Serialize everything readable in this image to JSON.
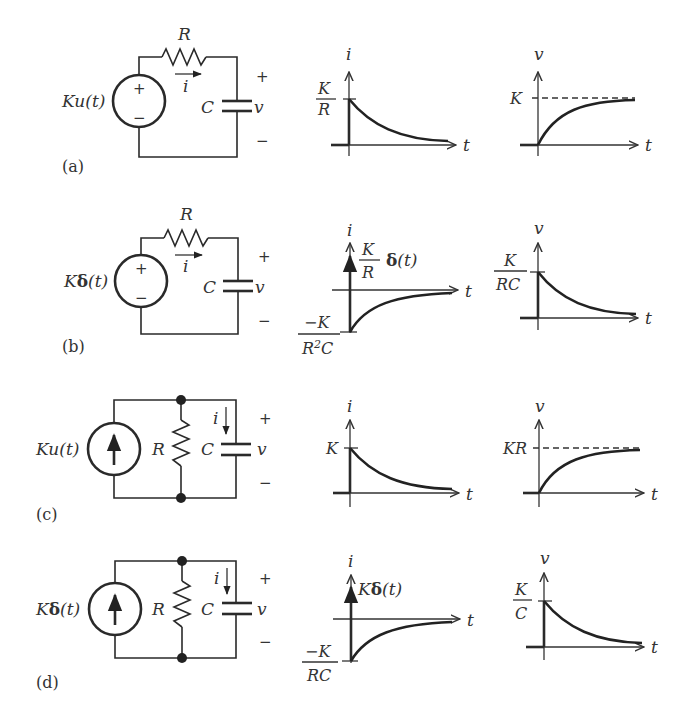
{
  "figure": {
    "panels": [
      {
        "id": "a",
        "label": "(a)",
        "circuit": {
          "type": "series RC",
          "source": "Ku(t)",
          "source_kind": "voltage",
          "resistor": "R",
          "capacitor": "C",
          "current": "i",
          "voltage": "v",
          "plus": "+",
          "minus": "−"
        },
        "current_plot": {
          "y_label": "i",
          "x_label": "t",
          "level_num": "K",
          "level_den": "R",
          "shape": "decaying exponential from K/R"
        },
        "voltage_plot": {
          "y_label": "v",
          "x_label": "t",
          "level": "K",
          "shape": "rising exponential to K (dashed asymptote)"
        }
      },
      {
        "id": "b",
        "label": "(b)",
        "circuit": {
          "type": "series RC",
          "source_prefix": "K",
          "source_delta": "δ",
          "source_suffix": "(t)",
          "source_kind": "voltage",
          "resistor": "R",
          "capacitor": "C",
          "current": "i",
          "voltage": "v",
          "plus": "+",
          "minus": "−"
        },
        "current_plot": {
          "y_label": "i",
          "x_label": "t",
          "impulse_num": "K",
          "impulse_den": "R",
          "impulse_delta": "δ",
          "impulse_suffix": "(t)",
          "neg_num": "−K",
          "neg_den_a": "R",
          "neg_den_sup": "2",
          "neg_den_b": "C",
          "shape": "impulse plus negative exponential rising to 0"
        },
        "voltage_plot": {
          "y_label": "v",
          "x_label": "t",
          "level_num": "K",
          "level_den": "RC",
          "shape": "decaying exponential from K/RC"
        }
      },
      {
        "id": "c",
        "label": "(c)",
        "circuit": {
          "type": "parallel RC",
          "source": "Ku(t)",
          "source_kind": "current",
          "resistor": "R",
          "capacitor": "C",
          "current": "i",
          "voltage": "v",
          "plus": "+",
          "minus": "−"
        },
        "current_plot": {
          "y_label": "i",
          "x_label": "t",
          "level": "K",
          "shape": "decaying exponential from K"
        },
        "voltage_plot": {
          "y_label": "v",
          "x_label": "t",
          "level": "KR",
          "shape": "rising exponential to KR (dashed asymptote)"
        }
      },
      {
        "id": "d",
        "label": "(d)",
        "circuit": {
          "type": "parallel RC",
          "source_prefix": "K",
          "source_delta": "δ",
          "source_suffix": "(t)",
          "source_kind": "current",
          "resistor": "R",
          "capacitor": "C",
          "current": "i",
          "voltage": "v",
          "plus": "+",
          "minus": "−"
        },
        "current_plot": {
          "y_label": "i",
          "x_label": "t",
          "impulse_prefix": "K",
          "impulse_delta": "δ",
          "impulse_suffix": "(t)",
          "neg_num": "−K",
          "neg_den": "RC",
          "shape": "impulse plus negative exponential rising to 0"
        },
        "voltage_plot": {
          "y_label": "v",
          "x_label": "t",
          "level_num": "K",
          "level_den": "C",
          "shape": "decaying exponential from K/C"
        }
      }
    ]
  }
}
